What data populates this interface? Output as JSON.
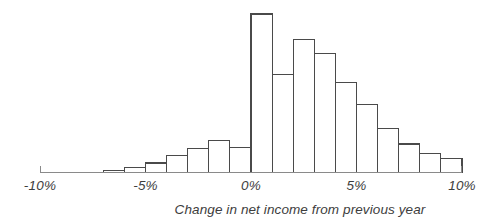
{
  "chart_data": {
    "type": "bar",
    "title": "",
    "subtitle": "",
    "xlabel": "Change in net income from previous year",
    "ylabel": "",
    "grid": false,
    "legend": null,
    "xlim": [
      -10,
      10
    ],
    "ylim": [
      0,
      100
    ],
    "bin_width": 1,
    "bin_unit": "%",
    "x_tick_labels": [
      "-10%",
      "-5%",
      "0%",
      "5%",
      "10%"
    ],
    "x_tick_values": [
      -10,
      -5,
      0,
      5,
      10
    ],
    "categories": [
      "-10% to -9%",
      "-9% to -8%",
      "-8% to -7%",
      "-7% to -6%",
      "-6% to -5%",
      "-5% to -4%",
      "-4% to -3%",
      "-3% to -2%",
      "-2% to -1%",
      "-1% to 0%",
      "0% to 1%",
      "1% to 2%",
      "2% to 3%",
      "3% to 4%",
      "4% to 5%",
      "5% to 6%",
      "6% to 7%",
      "7% to 8%",
      "8% to 9%",
      "9% to 10%"
    ],
    "bin_starts": [
      -10,
      -9,
      -8,
      -7,
      -6,
      -5,
      -4,
      -3,
      -2,
      -1,
      0,
      1,
      2,
      3,
      4,
      5,
      6,
      7,
      8,
      9
    ],
    "values": [
      0,
      0,
      0,
      1,
      3,
      6,
      11,
      15,
      20,
      16,
      100,
      62,
      84,
      75,
      57,
      43,
      28,
      18,
      12,
      9
    ],
    "axis_color": "#8a8a8a",
    "bar_stroke_color": "#4a4a4a",
    "bar_fill_color": "#ffffff",
    "text_color": "#3d3d3d",
    "background_color": "#ffffff"
  },
  "caption": {
    "text": "Change in net income from previous year"
  },
  "axis": {
    "x_labels": [
      {
        "text": "-10%",
        "value": -10
      },
      {
        "text": "-5%",
        "value": -5
      },
      {
        "text": "0%",
        "value": 0
      },
      {
        "text": "5%",
        "value": 5
      },
      {
        "text": "10%",
        "value": 10
      }
    ]
  }
}
